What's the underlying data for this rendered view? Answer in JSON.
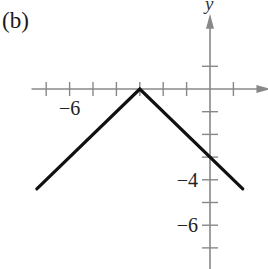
{
  "panel_label": "(b)",
  "chart_data": {
    "type": "line",
    "title": "(b)",
    "xlabel": "x",
    "ylabel": "y",
    "function": "y = -|x + 3|",
    "series": [
      {
        "name": "graph",
        "x": [
          -7.4,
          -3,
          1.4
        ],
        "y": [
          -4.4,
          0,
          -4.4
        ]
      }
    ],
    "vertex": [
      -3,
      0
    ],
    "y_intercept": [
      0,
      -3
    ],
    "xlim": [
      -7.5,
      1.9
    ],
    "ylim": [
      -7.5,
      2.7
    ],
    "x_ticks": [
      -7,
      -6,
      -5,
      -4,
      -3,
      -2,
      -1,
      1
    ],
    "x_tick_labels": [
      {
        "value": -6,
        "label": "−6"
      }
    ],
    "y_ticks": [
      1,
      -1,
      -2,
      -3,
      -4,
      -5,
      -6,
      -7
    ],
    "y_tick_labels": [
      {
        "value": -4,
        "label": "−4"
      },
      {
        "value": -6,
        "label": "−6"
      }
    ],
    "grid": false,
    "colors": {
      "axis": "#888888",
      "line": "#111111",
      "background": "#ffffff"
    }
  }
}
